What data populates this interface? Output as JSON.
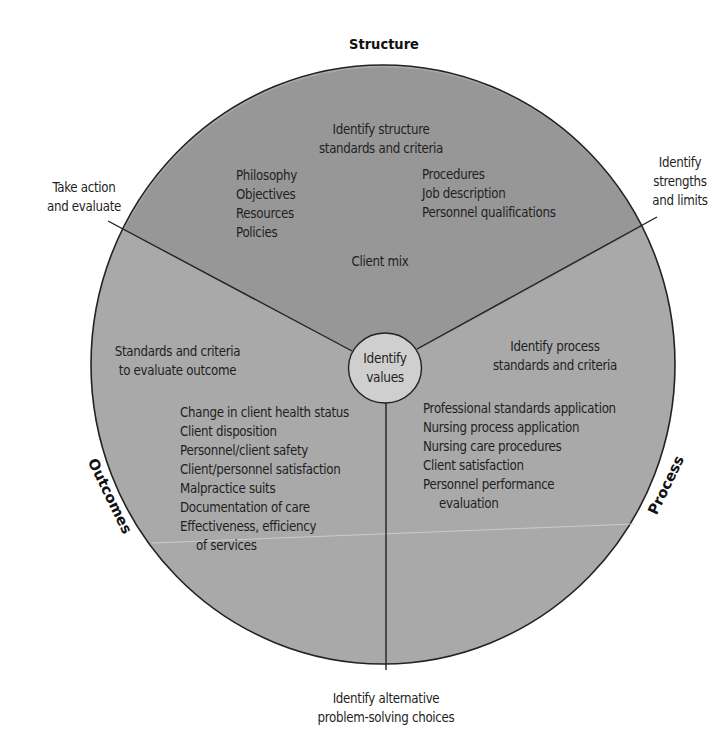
{
  "diagram": {
    "colors": {
      "background": "#ffffff",
      "structure_wedge": "#979797",
      "lower_region": "#a9a9a9",
      "center_circle": "#cfcfcf",
      "outline": "#222222",
      "scan_line": "#d8d8d8"
    },
    "sections": {
      "structure": {
        "title": "Structure",
        "heading_line1": "Identify structure",
        "heading_line2": "standards and criteria",
        "left_items": [
          "Philosophy",
          "Objectives",
          "Resources",
          "Policies"
        ],
        "right_items": [
          "Procedures",
          "Job description",
          "Personnel qualifications"
        ],
        "bottom_item": "Client mix"
      },
      "process": {
        "title": "Process",
        "heading_line1": "Identify process",
        "heading_line2": "standards and criteria",
        "items": [
          "Professional standards application",
          "Nursing process application",
          "Nursing care procedures",
          "Client satisfaction",
          "Personnel performance"
        ],
        "item_continuation": "evaluation"
      },
      "outcomes": {
        "title": "Outcomes",
        "heading_line1": "Standards and criteria",
        "heading_line2": "to evaluate outcome",
        "items": [
          "Change in client health status",
          "Client disposition",
          "Personnel/client safety",
          "Client/personnel satisfaction",
          "Malpractice suits",
          "Documentation of care",
          "Effectiveness, efficiency"
        ],
        "item_continuation": "of services"
      }
    },
    "center": {
      "line1": "Identify",
      "line2": "values"
    },
    "spoke_labels": {
      "upper_left": {
        "line1": "Take action",
        "line2": "and evaluate"
      },
      "upper_right": {
        "line1": "Identify",
        "line2": "strengths",
        "line3": "and limits"
      },
      "bottom": {
        "line1": "Identify alternative",
        "line2": "problem-solving choices"
      }
    }
  }
}
